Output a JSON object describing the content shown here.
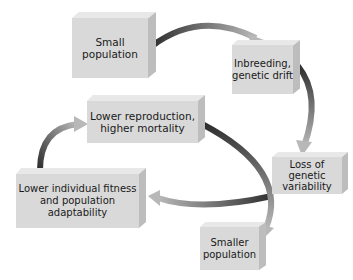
{
  "diagram": {
    "colors": {
      "background": "#ffffff",
      "box_front": "#d9d9d9",
      "box_top": "#e8e8e8",
      "box_side": "#bdbdbd",
      "arrow_dark": "#333333",
      "arrow_light": "#b0b0b0"
    },
    "nodes": [
      {
        "id": "small-population",
        "label": "Small population"
      },
      {
        "id": "inbreeding-drift",
        "label": "Inbreeding, genetic drift"
      },
      {
        "id": "loss-variability",
        "label": "Loss of genetic variability"
      },
      {
        "id": "lower-fitness",
        "label": "Lower individual fitness and population adaptability"
      },
      {
        "id": "lower-reproduction",
        "label": "Lower reproduction, higher mortality"
      },
      {
        "id": "smaller-population",
        "label": "Smaller population"
      }
    ],
    "edges": [
      {
        "from": "small-population",
        "to": "inbreeding-drift"
      },
      {
        "from": "inbreeding-drift",
        "to": "loss-variability"
      },
      {
        "from": "loss-variability",
        "to": "lower-fitness"
      },
      {
        "from": "lower-fitness",
        "to": "lower-reproduction"
      },
      {
        "from": "lower-reproduction",
        "to": "smaller-population"
      }
    ]
  }
}
